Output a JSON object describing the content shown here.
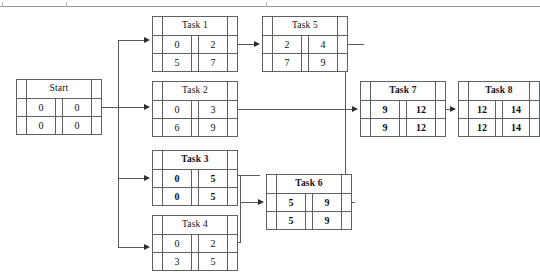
{
  "diagram": {
    "kind": "activity-on-node PERT/CPM network",
    "critical_path_style": "bold"
  },
  "nodes": [
    {
      "id": "start",
      "label": "Start",
      "early_start": "0",
      "early_finish": "0",
      "late_start": "0",
      "late_finish": "0",
      "critical": false,
      "x": 16,
      "y": 79,
      "w": 86,
      "h": 56
    },
    {
      "id": "task1",
      "label": "Task 1",
      "early_start": "0",
      "early_finish": "2",
      "late_start": "5",
      "late_finish": "7",
      "critical": false,
      "x": 152,
      "y": 16,
      "w": 86,
      "h": 56
    },
    {
      "id": "task2",
      "label": "Task 2",
      "early_start": "0",
      "early_finish": "3",
      "late_start": "6",
      "late_finish": "9",
      "critical": false,
      "x": 152,
      "y": 81,
      "w": 86,
      "h": 56
    },
    {
      "id": "task3",
      "label": "Task 3",
      "early_start": "0",
      "early_finish": "5",
      "late_start": "0",
      "late_finish": "5",
      "critical": true,
      "x": 152,
      "y": 150,
      "w": 86,
      "h": 56
    },
    {
      "id": "task4",
      "label": "Task 4",
      "early_start": "0",
      "early_finish": "2",
      "late_start": "3",
      "late_finish": "5",
      "critical": false,
      "x": 152,
      "y": 215,
      "w": 86,
      "h": 56
    },
    {
      "id": "task5",
      "label": "Task 5",
      "early_start": "2",
      "early_finish": "4",
      "late_start": "7",
      "late_finish": "9",
      "critical": false,
      "x": 262,
      "y": 16,
      "w": 86,
      "h": 56
    },
    {
      "id": "task6",
      "label": "Task 6",
      "early_start": "5",
      "early_finish": "9",
      "late_start": "5",
      "late_finish": "9",
      "critical": true,
      "x": 266,
      "y": 174,
      "w": 86,
      "h": 56
    },
    {
      "id": "task7",
      "label": "Task 7",
      "early_start": "9",
      "early_finish": "12",
      "late_start": "9",
      "late_finish": "12",
      "critical": true,
      "x": 360,
      "y": 81,
      "w": 86,
      "h": 56
    },
    {
      "id": "task8",
      "label": "Task 8",
      "early_start": "12",
      "early_finish": "14",
      "late_start": "12",
      "late_finish": "14",
      "critical": true,
      "x": 458,
      "y": 81,
      "w": 86,
      "h": 56
    }
  ],
  "edges": [
    {
      "from": "start",
      "to": "task1"
    },
    {
      "from": "start",
      "to": "task2"
    },
    {
      "from": "start",
      "to": "task3"
    },
    {
      "from": "start",
      "to": "task4"
    },
    {
      "from": "task1",
      "to": "task5"
    },
    {
      "from": "task2",
      "to": "task7"
    },
    {
      "from": "task3",
      "to": "task6"
    },
    {
      "from": "task4",
      "to": "task6"
    },
    {
      "from": "task5",
      "to": "task7"
    },
    {
      "from": "task6",
      "to": "task7"
    },
    {
      "from": "task7",
      "to": "task8"
    }
  ]
}
